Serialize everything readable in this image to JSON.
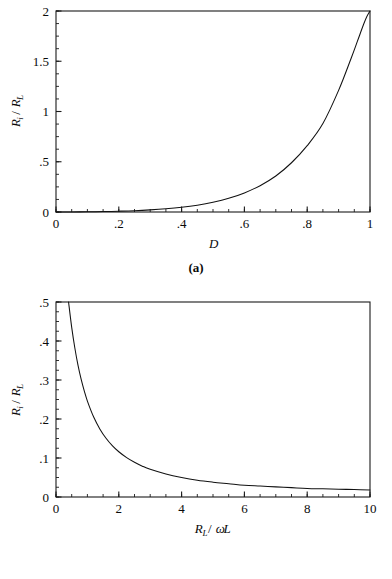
{
  "figure": {
    "panels": [
      {
        "caption": "(a)",
        "chart_data": {
          "type": "line",
          "title": "",
          "xlabel": "D",
          "xlabel_parts": {
            "base": "D",
            "sub": ""
          },
          "ylabel": "R_i/R_L",
          "ylabel_parts": {
            "num_base": "R",
            "num_sub": "i",
            "slash": "/",
            "den_base": "R",
            "den_sub": "L"
          },
          "xlim": [
            0,
            1
          ],
          "ylim": [
            0,
            2
          ],
          "grid": false,
          "legend": "none",
          "xticks": [
            0,
            0.2,
            0.4,
            0.6,
            0.8,
            1
          ],
          "xtick_labels": [
            "0",
            ".2",
            ".4",
            ".6",
            ".8",
            "1"
          ],
          "xminor_step": 0.05,
          "yticks": [
            0,
            0.5,
            1,
            1.5,
            2
          ],
          "ytick_labels": [
            "0",
            ".5",
            "1",
            "1.5",
            "2"
          ],
          "yminor_step": 0.125,
          "series": [
            {
              "name": "Ri/RL vs D",
              "x": [
                0.0,
                0.05,
                0.1,
                0.15,
                0.2,
                0.25,
                0.3,
                0.35,
                0.4,
                0.45,
                0.5,
                0.55,
                0.6,
                0.65,
                0.7,
                0.75,
                0.8,
                0.85,
                0.9,
                0.94,
                0.96,
                0.98,
                0.99,
                1.0
              ],
              "y": [
                0.0,
                0.0005,
                0.002,
                0.004,
                0.008,
                0.013,
                0.021,
                0.032,
                0.047,
                0.068,
                0.097,
                0.136,
                0.19,
                0.262,
                0.358,
                0.49,
                0.66,
                0.88,
                1.21,
                1.53,
                1.7,
                1.87,
                1.945,
                2.0
              ]
            }
          ]
        }
      },
      {
        "caption": "(b)",
        "chart_data": {
          "type": "line",
          "title": "",
          "xlabel": "R_L/ωL",
          "xlabel_parts": {
            "num_base": "R",
            "num_sub": "L",
            "slash": "/",
            "den_omega": "ω",
            "den_base": "L"
          },
          "ylabel": "R_i/R_L",
          "ylabel_parts": {
            "num_base": "R",
            "num_sub": "i",
            "slash": "/",
            "den_base": "R",
            "den_sub": "L"
          },
          "xlim": [
            0,
            10
          ],
          "ylim": [
            0,
            0.5
          ],
          "grid": false,
          "legend": "none",
          "xticks": [
            0,
            2,
            4,
            6,
            8,
            10
          ],
          "xtick_labels": [
            "0",
            "2",
            "4",
            "6",
            "8",
            "10"
          ],
          "xminor_step": 0.5,
          "yticks": [
            0,
            0.1,
            0.2,
            0.3,
            0.4,
            0.5
          ],
          "ytick_labels": [
            "0",
            ".1",
            ".2",
            ".3",
            ".4",
            ".5"
          ],
          "yminor_step": 0.025,
          "series": [
            {
              "name": "Ri/RL vs RL/wL",
              "x": [
                0.4,
                0.5,
                0.6,
                0.7,
                0.8,
                0.9,
                1.0,
                1.2,
                1.4,
                1.6,
                1.8,
                2.0,
                2.25,
                2.5,
                2.75,
                3.0,
                3.5,
                4.0,
                4.5,
                5.0,
                5.5,
                6.0,
                6.5,
                7.0,
                7.5,
                8.0,
                8.5,
                9.0,
                9.5,
                10.0
              ],
              "y": [
                0.5,
                0.435,
                0.382,
                0.338,
                0.302,
                0.272,
                0.246,
                0.205,
                0.174,
                0.15,
                0.131,
                0.116,
                0.101,
                0.089,
                0.079,
                0.071,
                0.059,
                0.05,
                0.043,
                0.038,
                0.034,
                0.03,
                0.028,
                0.026,
                0.024,
                0.022,
                0.021,
                0.02,
                0.019,
                0.018
              ]
            }
          ]
        }
      }
    ]
  },
  "colors": {
    "ink": "#0a0a0a",
    "curve": "#111111",
    "frame": "#1a1a1a",
    "background": "#ffffff"
  }
}
